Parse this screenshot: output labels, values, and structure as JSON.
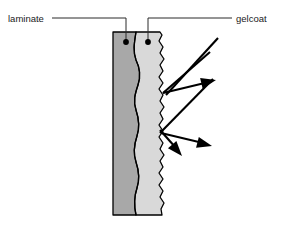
{
  "figure": {
    "type": "cross-section-diagram",
    "background_color": "#ffffff"
  },
  "labels": [
    {
      "id": "laminate",
      "text": "laminate",
      "text_x": 8,
      "text_y": 22,
      "anchor": "start",
      "leader_path": "M 52 18 L 126 18 L 126 40",
      "dot_x": 126,
      "dot_y": 42
    },
    {
      "id": "gelcoat",
      "text": "gelcoat",
      "text_x": 236,
      "text_y": 22,
      "anchor": "start",
      "leader_path": "M 232 18 L 148 18 L 148 40",
      "dot_x": 148,
      "dot_y": 42
    }
  ],
  "layers": [
    {
      "id": "laminate-layer",
      "name": "laminate",
      "fill_color": "#a8a8a8",
      "description": "dark grey inner layer with smooth wavy right boundary"
    },
    {
      "id": "gelcoat-layer",
      "name": "gelcoat",
      "fill_color": "#d9d9d9",
      "description": "light grey outer layer with finely serrated rough outer surface"
    }
  ],
  "geometry": {
    "laminate_left_x": 113,
    "top_y": 32,
    "bottom_y": 215,
    "wavy_interface_path": "M 113 32 L 136 32 C 134 44 133 52 136 60 C 140 68 141 76 138 85 C 135 94 133 101 136 110 C 139 119 140 127 137 136 C 134 145 133 153 136 162 C 139 171 140 179 137 188 C 134 197 134 206 136 215 L 113 215 Z",
    "gelcoat_outer_path": "M 136 32 C 134 44 133 52 136 60 C 140 68 141 76 138 85 C 135 94 133 101 136 110 C 139 119 140 127 137 136 C 134 145 133 153 136 162 C 139 171 140 179 137 188 C 134 197 134 206 136 215 L 162 215 L 161 209 L 164 203 L 160 197 L 163 191 L 159 185 L 163 179 L 159 173 L 163 167 L 160 161 L 164 155 L 160 149 L 163 143 L 159 137 L 163 131 L 159 125 L 163 119 L 160 113 L 164 107 L 160 101 L 163 95 L 159 89 L 163 83 L 159 77 L 163 71 L 160 65 L 164 59 L 160 53 L 163 47 L 159 41 L 162 35 L 160 32 Z"
  },
  "rays": [
    {
      "id": "incident-ray-1",
      "kind": "incident",
      "path": "M 218 38 L 166 95",
      "has_arrowhead": false
    },
    {
      "id": "incident-ray-2",
      "kind": "incident",
      "path": "M 210 52 L 163 93",
      "has_arrowhead": false
    },
    {
      "id": "reflected-ray-1",
      "kind": "reflected",
      "path": "M 163 93 L 209 82",
      "has_arrowhead": true,
      "arrow_tip": [
        216,
        80
      ],
      "arrow_angle": -13
    },
    {
      "id": "incident-ray-3",
      "kind": "incident",
      "path": "M 213 79 L 160 133",
      "has_arrowhead": false
    },
    {
      "id": "scattered-ray-down-left",
      "kind": "scattered",
      "path": "M 160 130 L 176 148",
      "has_arrowhead": true,
      "arrow_tip": [
        182,
        156
      ],
      "arrow_angle": 49
    },
    {
      "id": "scattered-ray-down-right",
      "kind": "scattered",
      "path": "M 161 133 L 203 143",
      "has_arrowhead": true,
      "arrow_tip": [
        212,
        146
      ],
      "arrow_angle": 14
    }
  ]
}
